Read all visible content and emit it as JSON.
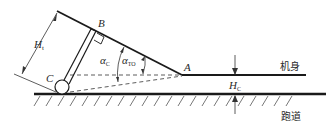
{
  "diagram": {
    "title": "",
    "points": {
      "A": "A",
      "B": "B",
      "C": "C"
    },
    "angles": {
      "alpha_c": {
        "symbol": "α",
        "subscript": "C"
      },
      "alpha_to": {
        "symbol": "α",
        "subscript": "TO"
      }
    },
    "dimensions": {
      "h_t": {
        "symbol": "H",
        "subscript": "t"
      },
      "h_c": {
        "symbol": "H",
        "subscript": "C"
      }
    },
    "labels": {
      "fuselage": "机身",
      "runway": "跑道"
    },
    "colors": {
      "line": "#1a1a1a",
      "background": "#ffffff"
    }
  }
}
